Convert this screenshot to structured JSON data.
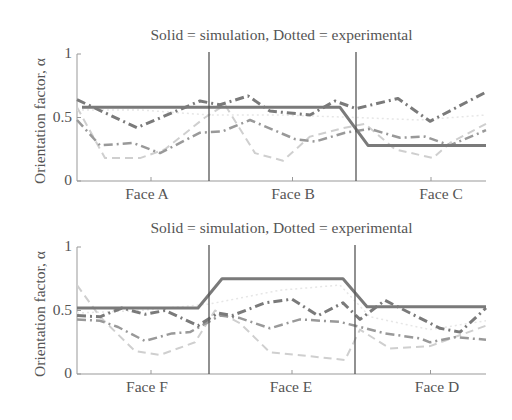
{
  "chart_data": [
    {
      "type": "line",
      "title": "Solid = simulation, Dotted = experimental",
      "xlabel": "",
      "ylabel": "Orientation factor, α",
      "ylim": [
        0,
        1
      ],
      "yticks": [
        "0",
        "0.5",
        "1"
      ],
      "categories": [
        "Face A",
        "Face B",
        "Face C"
      ],
      "grid": false,
      "x_pixel": [
        77,
        486
      ],
      "dividers_px": [
        209,
        356
      ],
      "series": [
        {
          "name": "simulation",
          "style": "solid",
          "color": "#7a7a7a",
          "width": 3,
          "points": [
            [
              82,
              0.58
            ],
            [
              340,
              0.58
            ],
            [
              368,
              0.28
            ],
            [
              486,
              0.28
            ]
          ]
        },
        {
          "name": "experimental-1",
          "style": "dashdot",
          "color": "#7a7a7a",
          "width": 3,
          "points": [
            [
              77,
              0.64
            ],
            [
              137,
              0.42
            ],
            [
              200,
              0.63
            ],
            [
              220,
              0.6
            ],
            [
              248,
              0.67
            ],
            [
              270,
              0.55
            ],
            [
              310,
              0.52
            ],
            [
              335,
              0.63
            ],
            [
              356,
              0.57
            ],
            [
              398,
              0.65
            ],
            [
              430,
              0.47
            ],
            [
              486,
              0.7
            ]
          ]
        },
        {
          "name": "experimental-2",
          "style": "dashdot",
          "color": "#999999",
          "width": 2.5,
          "points": [
            [
              77,
              0.48
            ],
            [
              100,
              0.28
            ],
            [
              133,
              0.3
            ],
            [
              160,
              0.22
            ],
            [
              200,
              0.38
            ],
            [
              222,
              0.39
            ],
            [
              250,
              0.48
            ],
            [
              295,
              0.33
            ],
            [
              315,
              0.31
            ],
            [
              345,
              0.38
            ],
            [
              370,
              0.41
            ],
            [
              400,
              0.34
            ],
            [
              425,
              0.35
            ],
            [
              450,
              0.28
            ],
            [
              486,
              0.4
            ]
          ]
        },
        {
          "name": "experimental-3",
          "style": "dashed",
          "color": "#cfcfcf",
          "width": 2,
          "points": [
            [
              77,
              0.58
            ],
            [
              105,
              0.18
            ],
            [
              140,
              0.18
            ],
            [
              165,
              0.25
            ],
            [
              205,
              0.5
            ],
            [
              225,
              0.6
            ],
            [
              255,
              0.22
            ],
            [
              283,
              0.16
            ],
            [
              310,
              0.35
            ],
            [
              345,
              0.42
            ],
            [
              365,
              0.45
            ],
            [
              395,
              0.25
            ],
            [
              433,
              0.18
            ],
            [
              450,
              0.3
            ],
            [
              486,
              0.45
            ]
          ]
        },
        {
          "name": "experimental-4",
          "style": "dotted",
          "color": "#e6e6e6",
          "width": 1.5,
          "points": [
            [
              77,
              0.56
            ],
            [
              140,
              0.56
            ],
            [
              209,
              0.52
            ],
            [
              280,
              0.52
            ],
            [
              356,
              0.5
            ],
            [
              420,
              0.48
            ],
            [
              486,
              0.52
            ]
          ]
        }
      ]
    },
    {
      "type": "line",
      "title": "Solid = simulation, Dotted = experimental",
      "xlabel": "",
      "ylabel": "Orientation factor, α",
      "ylim": [
        0,
        1
      ],
      "yticks": [
        "0",
        "0.5",
        "1"
      ],
      "categories": [
        "Face F",
        "Face E",
        "Face D"
      ],
      "grid": false,
      "x_pixel": [
        77,
        486
      ],
      "dividers_px": [
        209,
        355
      ],
      "series": [
        {
          "name": "simulation",
          "style": "solid",
          "color": "#7a7a7a",
          "width": 3,
          "points": [
            [
              77,
              0.52
            ],
            [
              198,
              0.52
            ],
            [
              222,
              0.75
            ],
            [
              343,
              0.75
            ],
            [
              367,
              0.53
            ],
            [
              486,
              0.53
            ]
          ]
        },
        {
          "name": "experimental-1",
          "style": "dashdot",
          "color": "#7a7a7a",
          "width": 3,
          "points": [
            [
              77,
              0.46
            ],
            [
              100,
              0.45
            ],
            [
              122,
              0.52
            ],
            [
              145,
              0.47
            ],
            [
              165,
              0.5
            ],
            [
              198,
              0.38
            ],
            [
              218,
              0.48
            ],
            [
              232,
              0.46
            ],
            [
              265,
              0.56
            ],
            [
              292,
              0.59
            ],
            [
              318,
              0.46
            ],
            [
              343,
              0.56
            ],
            [
              360,
              0.43
            ],
            [
              385,
              0.58
            ],
            [
              410,
              0.48
            ],
            [
              440,
              0.36
            ],
            [
              460,
              0.33
            ],
            [
              486,
              0.52
            ]
          ]
        },
        {
          "name": "experimental-2",
          "style": "dashdot",
          "color": "#999999",
          "width": 2.5,
          "points": [
            [
              77,
              0.43
            ],
            [
              100,
              0.42
            ],
            [
              118,
              0.37
            ],
            [
              145,
              0.26
            ],
            [
              172,
              0.32
            ],
            [
              190,
              0.33
            ],
            [
              220,
              0.46
            ],
            [
              240,
              0.44
            ],
            [
              270,
              0.36
            ],
            [
              300,
              0.43
            ],
            [
              340,
              0.41
            ],
            [
              360,
              0.37
            ],
            [
              385,
              0.32
            ],
            [
              420,
              0.28
            ],
            [
              430,
              0.25
            ],
            [
              455,
              0.29
            ],
            [
              486,
              0.27
            ]
          ]
        },
        {
          "name": "experimental-3",
          "style": "dashed",
          "color": "#cfcfcf",
          "width": 2,
          "points": [
            [
              77,
              0.7
            ],
            [
              100,
              0.45
            ],
            [
              135,
              0.18
            ],
            [
              160,
              0.15
            ],
            [
              195,
              0.25
            ],
            [
              215,
              0.5
            ],
            [
              240,
              0.4
            ],
            [
              270,
              0.17
            ],
            [
              310,
              0.14
            ],
            [
              345,
              0.11
            ],
            [
              360,
              0.35
            ],
            [
              390,
              0.2
            ],
            [
              430,
              0.22
            ],
            [
              486,
              0.38
            ]
          ]
        },
        {
          "name": "experimental-4",
          "style": "dotted",
          "color": "#e6e6e6",
          "width": 1.5,
          "points": [
            [
              77,
              0.48
            ],
            [
              140,
              0.5
            ],
            [
              209,
              0.55
            ],
            [
              280,
              0.66
            ],
            [
              340,
              0.7
            ],
            [
              370,
              0.45
            ],
            [
              430,
              0.35
            ],
            [
              486,
              0.42
            ]
          ]
        }
      ]
    }
  ],
  "panels": [
    {
      "title": "Solid = simulation, Dotted = experimental",
      "ylabel": "Orientation factor, α",
      "yticks": {
        "t0": "0",
        "t05": "0.5",
        "t1": "1"
      },
      "xlabels": [
        "Face A",
        "Face B",
        "Face C"
      ]
    },
    {
      "title": "Solid = simulation, Dotted = experimental",
      "ylabel": "Orientation factor, α",
      "yticks": {
        "t0": "0",
        "t05": "0.5",
        "t1": "1"
      },
      "xlabels": [
        "Face F",
        "Face E",
        "Face D"
      ]
    }
  ]
}
